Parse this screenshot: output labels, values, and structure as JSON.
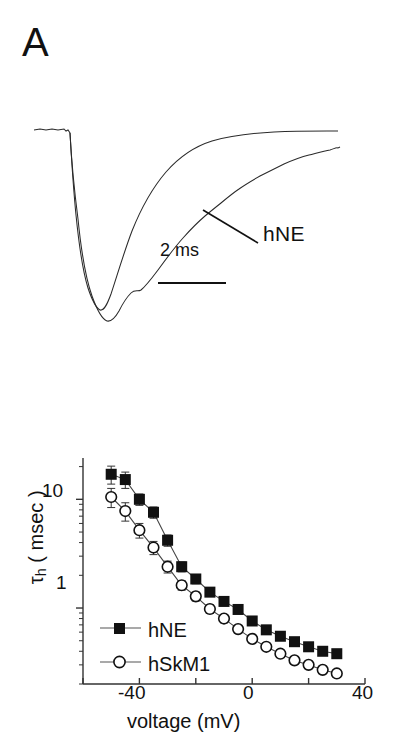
{
  "figure": {
    "panels": [
      {
        "id": "A",
        "letter": "A"
      },
      {
        "id": "B",
        "letter": "B"
      }
    ]
  },
  "panel_a": {
    "letter": "A",
    "trace_label": "hNE",
    "scalebar_label": "2 ms",
    "description": "Two superimposed normalized inward sodium current traces; the slower-decaying trace is labelled hNE, the faster one is hSkM1.",
    "traces": [
      {
        "name": "hSkM1",
        "label": null
      },
      {
        "name": "hNE",
        "label": "hNE"
      }
    ]
  },
  "panel_b": {
    "letter": "B",
    "y_axis_title_tau": "τ",
    "y_axis_title_sub": "h",
    "y_axis_title_rest": " ( msec )",
    "x_axis_title": "voltage (mV)",
    "y_tick_labels": [
      "10",
      "1"
    ],
    "x_tick_labels": [
      "-40",
      "0",
      "40"
    ],
    "legend": [
      {
        "label": "hNE",
        "marker": "filled-square"
      },
      {
        "label": "hSkM1",
        "marker": "open-circle"
      }
    ]
  },
  "chart_data": {
    "type": "line",
    "title": "",
    "xlabel": "voltage (mV)",
    "ylabel": "τh ( msec )",
    "yscale": "log",
    "xlim": [
      -60,
      40
    ],
    "ylim": [
      0.2,
      24
    ],
    "xticks": [
      -60,
      -40,
      -20,
      0,
      20,
      40
    ],
    "xticklabels": [
      "",
      "-40",
      "",
      "0",
      "",
      "40"
    ],
    "yticks": [
      1,
      10
    ],
    "yticklabels": [
      "1",
      "10"
    ],
    "grid": false,
    "legend_position": "lower-left",
    "x": [
      -50,
      -45,
      -40,
      -35,
      -30,
      -25,
      -20,
      -15,
      -10,
      -5,
      0,
      5,
      10,
      15,
      20,
      25,
      30
    ],
    "series": [
      {
        "name": "hNE",
        "marker": "filled-square",
        "values": [
          17.0,
          15.2,
          10.0,
          7.6,
          4.2,
          2.4,
          1.85,
          1.4,
          1.15,
          0.97,
          0.76,
          0.63,
          0.55,
          0.49,
          0.44,
          0.4,
          0.38
        ],
        "yerr": [
          3.2,
          2.6,
          1.2,
          0.9,
          0.5,
          0.25,
          0.18,
          0.12,
          0.1,
          0.08,
          0.06,
          0.05,
          0.04,
          0.04,
          0.03,
          0.03,
          0.03
        ]
      },
      {
        "name": "hSkM1",
        "marker": "open-circle",
        "values": [
          10.5,
          7.8,
          5.2,
          3.6,
          2.4,
          1.62,
          1.28,
          0.98,
          0.8,
          0.64,
          0.52,
          0.44,
          0.38,
          0.33,
          0.3,
          0.27,
          0.25
        ],
        "yerr": [
          2.1,
          1.5,
          0.8,
          0.5,
          0.3,
          0.16,
          0.12,
          0.09,
          0.07,
          0.05,
          0.04,
          0.03,
          0.03,
          0.02,
          0.02,
          0.02,
          0.02
        ]
      }
    ]
  }
}
